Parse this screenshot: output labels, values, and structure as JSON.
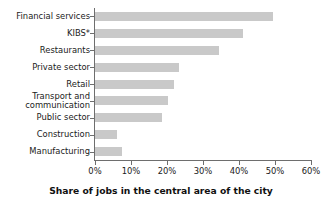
{
  "chart_data": {
    "type": "bar",
    "orientation": "horizontal",
    "title": "",
    "xlabel": "Share of jobs in the central area of the city",
    "ylabel": "",
    "categories": [
      "Financial services",
      "KIBS*",
      "Restaurants",
      "Private sector",
      "Retail",
      "Transport and\ncommunication",
      "Public sector",
      "Construction",
      "Manufacturing"
    ],
    "values": [
      49.5,
      41,
      34.5,
      23.3,
      22,
      20.3,
      18.5,
      6,
      7.5
    ],
    "value_unit": "%",
    "xlim": [
      0,
      60
    ],
    "xticks": [
      0,
      10,
      20,
      30,
      40,
      50,
      60
    ],
    "xtick_labels": [
      "0%",
      "10%",
      "20%",
      "30%",
      "40%",
      "50%",
      "60%"
    ],
    "grid": false,
    "legend": false,
    "bar_color": "#c9c9c9",
    "axis_color": "#6e6e6e",
    "text_color": "#1a1a1a"
  }
}
